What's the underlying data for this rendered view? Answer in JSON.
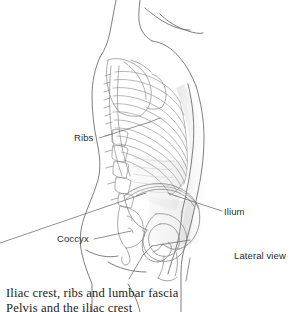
{
  "figure": {
    "view_note": "Lateral view",
    "background_color": "#ffffff",
    "line_color": "#8a8a8a",
    "outline_color": "#6f6f6f",
    "label_color": "#2a2a2a",
    "leader_color": "#6b6b6b"
  },
  "labels": {
    "ribs": "Ribs",
    "coccyx": "Coccyx",
    "ilium": "Ilium",
    "lateral_view": "Lateral view"
  },
  "caption": {
    "line1": "Iliac crest, ribs and lumbar fascia",
    "line2": "Pelvis and the iliac crest"
  },
  "anatomy": {
    "regions": [
      "neck",
      "shoulder",
      "scapula",
      "rib-cage",
      "thoracic-spine",
      "lumbar-spine",
      "sacrum",
      "coccyx",
      "pelvis-ilium",
      "femoral-head",
      "arm",
      "thigh"
    ],
    "rib_count": 12
  }
}
